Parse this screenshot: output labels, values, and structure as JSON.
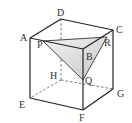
{
  "figure": {
    "type": "cube-with-cross-section",
    "colors": {
      "edge": "#222222",
      "hidden_edge": "#555555",
      "section_fill": "#d4d4d4",
      "section_highlight": "#eeeeee",
      "label": "#333333"
    },
    "vertices": {
      "A": {
        "label": "A"
      },
      "B": {
        "label": "B"
      },
      "C": {
        "label": "C"
      },
      "D": {
        "label": "D"
      },
      "E": {
        "label": "E"
      },
      "F": {
        "label": "F"
      },
      "G": {
        "label": "G"
      },
      "H": {
        "label": "H"
      }
    },
    "section_points": {
      "P": {
        "label": "P"
      },
      "Q": {
        "label": "Q"
      },
      "R": {
        "label": "R"
      }
    }
  }
}
